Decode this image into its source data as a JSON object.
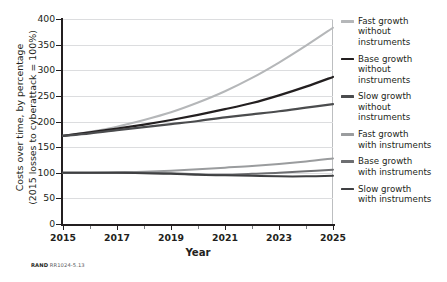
{
  "figure": {
    "source_note_prefix": "RAND",
    "source_note_id": "RR1024-5.13"
  },
  "chart_data": {
    "type": "line",
    "title": "",
    "xlabel": "Year",
    "ylabel": "Costs over time, by percentage\n(2015 losses to cyberattack = 100%)",
    "ylabel_line1": "Costs over time, by percentage",
    "ylabel_line2": "(2015 losses to cyberattack = 100%)",
    "xlim": [
      2015,
      2025
    ],
    "ylim": [
      0,
      400
    ],
    "ytick_labels": [
      "0",
      "50",
      "100",
      "150",
      "200",
      "250",
      "300",
      "350",
      "400"
    ],
    "ytick_values": [
      0,
      50,
      100,
      150,
      200,
      250,
      300,
      350,
      400
    ],
    "xtick_labels": [
      "2015",
      "2017",
      "2019",
      "2021",
      "2023",
      "2025"
    ],
    "xtick_values": [
      2015,
      2017,
      2019,
      2021,
      2023,
      2025
    ],
    "xtick_minor_values": [
      2016,
      2018,
      2020,
      2022,
      2024
    ],
    "grid": "horizontal",
    "legend_position": "right",
    "x": [
      2015,
      2016,
      2017,
      2018,
      2019,
      2020,
      2021,
      2022,
      2023,
      2024,
      2025
    ],
    "series": [
      {
        "name": "Fast growth without instruments",
        "legend_label": "Fast growth\nwithout\n instruments",
        "color": "#b5b7b9",
        "width": 2.0,
        "values": [
          172,
          180,
          190,
          203,
          218,
          237,
          259,
          285,
          315,
          348,
          383
        ]
      },
      {
        "name": "Base growth without instruments",
        "legend_label": "Base growth\nwithout\ninstruments",
        "color": "#231f20",
        "width": 2.2,
        "values": [
          172,
          179,
          186,
          194,
          203,
          213,
          224,
          236,
          251,
          268,
          287
        ]
      },
      {
        "name": "Slow growth without instruments",
        "legend_label": "Slow growth\nwithout\ninstruments",
        "color": "#4b4c4e",
        "width": 2.2,
        "values": [
          172,
          177,
          183,
          189,
          195,
          201,
          208,
          214,
          220,
          227,
          234
        ]
      },
      {
        "name": "Fast growth with instruments",
        "legend_label": "Fast growth\nwith instruments",
        "color": "#9a9c9e",
        "width": 2.0,
        "values": [
          100,
          100,
          101,
          102,
          104,
          107,
          110,
          113,
          117,
          122,
          128
        ]
      },
      {
        "name": "Base growth with instruments",
        "legend_label": "Base growth\nwith instruments",
        "color": "#6d6e71",
        "width": 2.0,
        "values": [
          100,
          100,
          100,
          100,
          99,
          97,
          96,
          98,
          100,
          103,
          106
        ]
      },
      {
        "name": "Slow growth with instruments",
        "legend_label": "Slow growth\nwith instruments",
        "color": "#3f4042",
        "width": 2.0,
        "values": [
          100,
          100,
          100,
          99,
          98,
          96,
          95,
          94,
          93,
          93,
          94
        ]
      }
    ]
  }
}
